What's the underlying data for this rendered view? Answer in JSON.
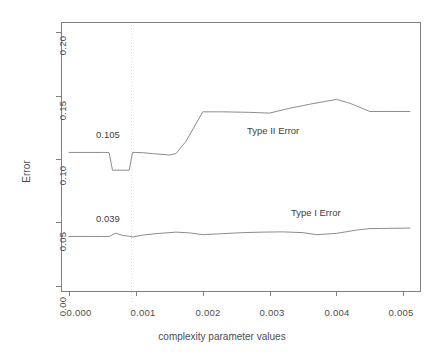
{
  "chart_data": {
    "type": "line",
    "title": "",
    "subtitle": "",
    "xlabel": "complexity parameter values",
    "ylabel": "Error",
    "xlim": [
      -0.00012,
      0.00525
    ],
    "ylim": [
      -0.004,
      0.208
    ],
    "xticks": [
      0.0,
      0.001,
      0.002,
      0.003,
      0.004,
      0.005
    ],
    "xtick_labels": [
      "0.000",
      "0.001",
      "0.002",
      "0.003",
      "0.004",
      "0.005"
    ],
    "yticks": [
      0.0,
      0.05,
      0.1,
      0.15,
      0.2
    ],
    "ytick_labels": [
      "0.00",
      "0.05",
      "0.10",
      "0.15",
      "0.20"
    ],
    "grid": false,
    "legend_position": "inline-annotations",
    "series": [
      {
        "name": "Type II Error",
        "color": "#8c8c8c",
        "label_text": "Type II Error",
        "x": [
          0.0,
          0.0003,
          0.0005,
          0.00055,
          0.0006,
          0.00065,
          0.00085,
          0.0009,
          0.00095,
          0.001,
          0.0011,
          0.00125,
          0.0015,
          0.0016,
          0.00175,
          0.002,
          0.0023,
          0.0027,
          0.003,
          0.0033,
          0.0036,
          0.004,
          0.0042,
          0.0045,
          0.0048,
          0.0051
        ],
        "y": [
          0.1052,
          0.1052,
          0.1052,
          0.1052,
          0.105,
          0.0912,
          0.0912,
          0.0912,
          0.1052,
          0.1052,
          0.105,
          0.1043,
          0.1032,
          0.1043,
          0.114,
          0.1372,
          0.1372,
          0.1368,
          0.1362,
          0.14,
          0.1432,
          0.147,
          0.144,
          0.1375,
          0.1375,
          0.1375
        ]
      },
      {
        "name": "Type I Error",
        "color": "#6e6e6e",
        "label_text": "Type I Error",
        "x": [
          0.0,
          0.0003,
          0.0005,
          0.0006,
          0.0007,
          0.0008,
          0.0009,
          0.00095,
          0.0011,
          0.0013,
          0.0016,
          0.0018,
          0.002,
          0.0023,
          0.0026,
          0.0029,
          0.0032,
          0.0035,
          0.0037,
          0.004,
          0.0043,
          0.0045,
          0.0048,
          0.0051
        ],
        "y": [
          0.039,
          0.039,
          0.039,
          0.039,
          0.0416,
          0.0398,
          0.0392,
          0.0386,
          0.04,
          0.0412,
          0.0424,
          0.0418,
          0.0404,
          0.0412,
          0.042,
          0.0424,
          0.0426,
          0.042,
          0.0404,
          0.0414,
          0.044,
          0.0452,
          0.0454,
          0.0456
        ]
      }
    ],
    "annotations": [
      {
        "name": "type-ii-value-label",
        "text": "0.105",
        "x": 0.00055,
        "y": 0.117
      },
      {
        "name": "type-i-value-label",
        "text": "0.039",
        "x": 0.00055,
        "y": 0.0505
      }
    ],
    "reference_lines": [
      {
        "name": "cp-reference-vline",
        "orientation": "vertical",
        "x": 0.00094,
        "style": "dotted",
        "color": "#dcdcdc"
      }
    ],
    "series_labels": [
      {
        "name": "type-ii-error-label",
        "text": "Type II Error",
        "x": 0.00264,
        "y": 0.1213
      },
      {
        "name": "type-i-error-label",
        "text": "Type I Error",
        "x": 0.00328,
        "y": 0.0533
      }
    ]
  }
}
